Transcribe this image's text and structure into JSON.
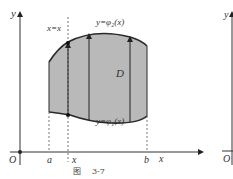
{
  "figure": {
    "caption_prefix": "图",
    "caption_number": "3-7",
    "colors": {
      "region_fill": "#b9b9b9",
      "stroke": "#2a2a2a",
      "axis": "#333333",
      "dashed": "#555555"
    },
    "axes": {
      "y_label": "y",
      "x_label": "x",
      "origin_label": "O"
    },
    "x_ticks": [
      {
        "label": "a"
      },
      {
        "label": "x"
      },
      {
        "label": "b"
      }
    ],
    "region_label": "D",
    "curves": {
      "upper": "y=φ₂(x)",
      "lower": "y=φ₁(x)"
    },
    "line_label": "x=x",
    "right_partial": {
      "y_label": "y",
      "origin_label": "O"
    }
  }
}
